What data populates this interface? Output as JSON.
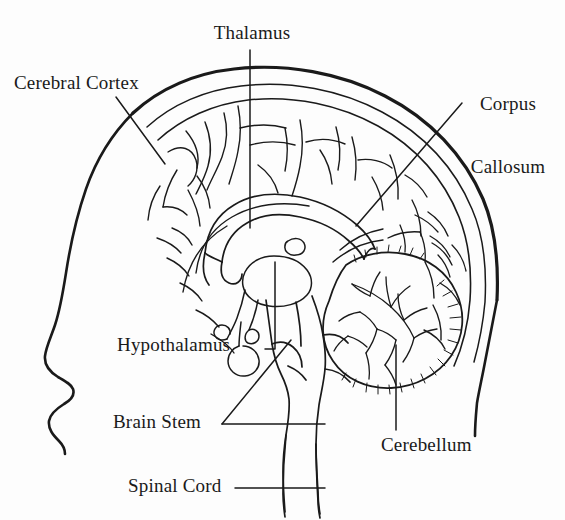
{
  "figure": {
    "kind": "anatomical-diagram",
    "background_color": "#fdfdfd",
    "ink_color": "#1a1a1a"
  },
  "labels": [
    {
      "id": "cerebral-cortex",
      "text": "Cerebral Cortex",
      "lines": [
        "Cerebral Cortex"
      ],
      "align": "left",
      "leader": "diagonal-down-right"
    },
    {
      "id": "thalamus",
      "text": "Thalamus",
      "lines": [
        "Thalamus"
      ],
      "align": "center",
      "leader": "vertical-down"
    },
    {
      "id": "corpus-callosum",
      "text": "Corpus Callosum",
      "lines": [
        "Corpus",
        "Callosum"
      ],
      "align": "center",
      "leader": "diagonal-down-left"
    },
    {
      "id": "hypothalamus",
      "text": "Hypothalamus",
      "lines": [
        "Hypothalamus"
      ],
      "align": "left",
      "leader": "elbow-right-up"
    },
    {
      "id": "brain-stem",
      "text": "Brain Stem",
      "lines": [
        "Brain Stem"
      ],
      "align": "left",
      "leader": "forked-right"
    },
    {
      "id": "spinal-cord",
      "text": "Spinal Cord",
      "lines": [
        "Spinal Cord"
      ],
      "align": "left",
      "leader": "horizontal-right"
    },
    {
      "id": "cerebellum",
      "text": "Cerebellum",
      "lines": [
        "Cerebellum"
      ],
      "align": "left",
      "leader": "vertical-up"
    }
  ],
  "label_text": {
    "cerebral_cortex": "Cerebral Cortex",
    "thalamus": "Thalamus",
    "corpus_line1": "Corpus",
    "corpus_line2": "Callosum",
    "hypothalamus": "Hypothalamus",
    "brain_stem": "Brain Stem",
    "spinal_cord": "Spinal Cord",
    "cerebellum": "Cerebellum"
  },
  "structures": [
    "head-profile-outline",
    "skull-outline",
    "cerebral-cortex-gyri",
    "corpus-callosum",
    "thalamus",
    "hypothalamus",
    "pituitary-gland",
    "brain-stem",
    "cerebellum",
    "spinal-cord"
  ]
}
